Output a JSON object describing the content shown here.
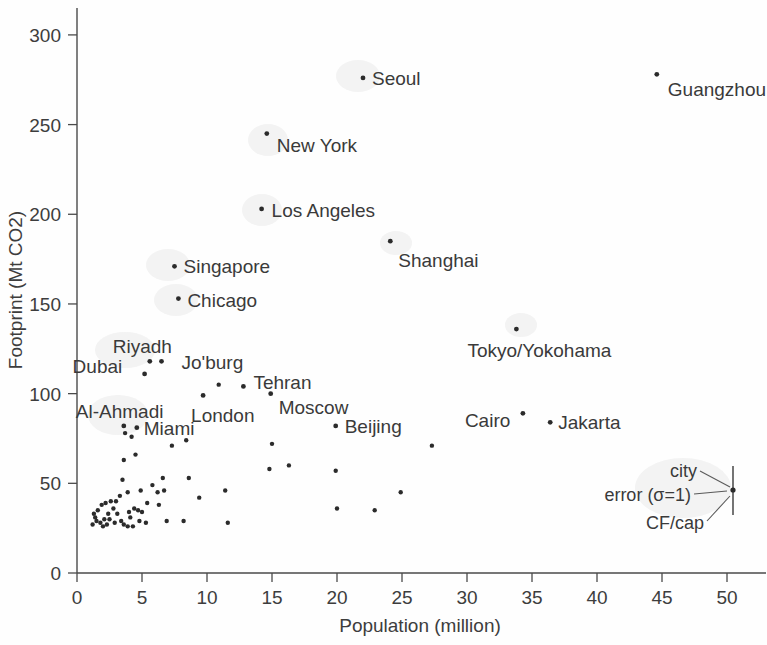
{
  "figure": {
    "background_color": "#fefefe",
    "ink_color": "#2b2b2b"
  },
  "chart_data": {
    "type": "scatter",
    "title": "",
    "xlabel": "Population (million)",
    "ylabel": "Footprint (Mt CO2)",
    "xlim": [
      0,
      53
    ],
    "ylim": [
      0,
      315
    ],
    "xticks": [
      0,
      5,
      10,
      15,
      20,
      25,
      30,
      35,
      40,
      45,
      50
    ],
    "xtick_labels": [
      "0",
      "5",
      "10",
      "15",
      "20",
      "25",
      "30",
      "35",
      "40",
      "45",
      "50"
    ],
    "yticks": [
      0,
      50,
      100,
      150,
      200,
      250,
      300
    ],
    "ytick_labels": [
      "0",
      "50",
      "100",
      "150",
      "200",
      "250",
      "300"
    ],
    "grid": false,
    "legend_position": "bottom-right",
    "labeled_points": [
      {
        "name": "Seoul",
        "x": 22.0,
        "y": 276,
        "label_dx": 9,
        "label_dy": 7
      },
      {
        "name": "Guangzhou",
        "x": 44.6,
        "y": 278,
        "label_dx": 11,
        "label_dy": 22
      },
      {
        "name": "New York",
        "x": 14.6,
        "y": 245,
        "label_dx": 10,
        "label_dy": 18
      },
      {
        "name": "Los Angeles",
        "x": 14.2,
        "y": 203,
        "label_dx": 10,
        "label_dy": 8
      },
      {
        "name": "Shanghai",
        "x": 24.1,
        "y": 185,
        "label_dx": 8,
        "label_dy": 26
      },
      {
        "name": "Singapore",
        "x": 7.5,
        "y": 171,
        "label_dx": 9,
        "label_dy": 7
      },
      {
        "name": "Chicago",
        "x": 7.8,
        "y": 153,
        "label_dx": 9,
        "label_dy": 8
      },
      {
        "name": "Tokyo/Yokohama",
        "x": 33.8,
        "y": 136,
        "label_dx": -49,
        "label_dy": 28
      },
      {
        "name": "Riyadh",
        "x": 5.6,
        "y": 118,
        "label_dx": -37,
        "label_dy": -8
      },
      {
        "name": "Dubai",
        "x": 5.2,
        "y": 111,
        "label_dx": -72,
        "label_dy": -1
      },
      {
        "name": "Jo'burg",
        "x": 6.5,
        "y": 118,
        "label_dx": 20,
        "label_dy": 8
      },
      {
        "name": "Tehran",
        "x": 12.8,
        "y": 104,
        "label_dx": 10,
        "label_dy": 3
      },
      {
        "name": "Moscow",
        "x": 14.9,
        "y": 100,
        "label_dx": 8,
        "label_dy": 20
      },
      {
        "name": "London",
        "x": 9.7,
        "y": 99,
        "label_dx": -12,
        "label_dy": 27
      },
      {
        "name": "Al-Ahmadi",
        "x": 3.6,
        "y": 82,
        "label_dx": -48,
        "label_dy": -8
      },
      {
        "name": "Miami",
        "x": 4.6,
        "y": 81,
        "label_dx": 7,
        "label_dy": 7
      },
      {
        "name": "Beijing",
        "x": 19.9,
        "y": 82,
        "label_dx": 9,
        "label_dy": 7
      },
      {
        "name": "Cairo",
        "x": 34.3,
        "y": 89,
        "label_dx": -58,
        "label_dy": 14
      },
      {
        "name": "Jakarta",
        "x": 36.4,
        "y": 84,
        "label_dx": 8,
        "label_dy": 7
      }
    ],
    "unlabeled_points": [
      {
        "x": 10.9,
        "y": 105
      },
      {
        "x": 16.3,
        "y": 60
      },
      {
        "x": 15.0,
        "y": 72
      },
      {
        "x": 14.8,
        "y": 58
      },
      {
        "x": 11.4,
        "y": 46
      },
      {
        "x": 9.4,
        "y": 42
      },
      {
        "x": 8.4,
        "y": 74
      },
      {
        "x": 8.6,
        "y": 53
      },
      {
        "x": 7.3,
        "y": 71
      },
      {
        "x": 6.6,
        "y": 53
      },
      {
        "x": 6.7,
        "y": 46
      },
      {
        "x": 6.2,
        "y": 45
      },
      {
        "x": 5.8,
        "y": 49
      },
      {
        "x": 5.4,
        "y": 39
      },
      {
        "x": 4.9,
        "y": 46
      },
      {
        "x": 4.5,
        "y": 66
      },
      {
        "x": 4.2,
        "y": 76
      },
      {
        "x": 3.7,
        "y": 78
      },
      {
        "x": 3.6,
        "y": 63
      },
      {
        "x": 3.5,
        "y": 52
      },
      {
        "x": 3.9,
        "y": 45
      },
      {
        "x": 3.3,
        "y": 43
      },
      {
        "x": 2.6,
        "y": 40
      },
      {
        "x": 2.2,
        "y": 39
      },
      {
        "x": 1.9,
        "y": 38
      },
      {
        "x": 1.6,
        "y": 35
      },
      {
        "x": 1.4,
        "y": 31
      },
      {
        "x": 1.2,
        "y": 27
      },
      {
        "x": 1.8,
        "y": 28
      },
      {
        "x": 2.1,
        "y": 30
      },
      {
        "x": 2.4,
        "y": 33
      },
      {
        "x": 2.8,
        "y": 36
      },
      {
        "x": 3.1,
        "y": 33
      },
      {
        "x": 3.4,
        "y": 29
      },
      {
        "x": 3.6,
        "y": 27
      },
      {
        "x": 3.9,
        "y": 26
      },
      {
        "x": 4.1,
        "y": 31
      },
      {
        "x": 4.4,
        "y": 36
      },
      {
        "x": 4.7,
        "y": 35
      },
      {
        "x": 4.3,
        "y": 26
      },
      {
        "x": 4.0,
        "y": 34
      },
      {
        "x": 5.0,
        "y": 34
      },
      {
        "x": 5.3,
        "y": 28
      },
      {
        "x": 6.3,
        "y": 38
      },
      {
        "x": 6.9,
        "y": 29
      },
      {
        "x": 8.2,
        "y": 29
      },
      {
        "x": 11.6,
        "y": 28
      },
      {
        "x": 19.9,
        "y": 57
      },
      {
        "x": 20.0,
        "y": 36
      },
      {
        "x": 22.9,
        "y": 35
      },
      {
        "x": 24.9,
        "y": 45
      },
      {
        "x": 27.3,
        "y": 71
      },
      {
        "x": 2.9,
        "y": 28
      },
      {
        "x": 2.0,
        "y": 26
      },
      {
        "x": 1.5,
        "y": 29
      },
      {
        "x": 2.3,
        "y": 27
      },
      {
        "x": 3.0,
        "y": 40
      },
      {
        "x": 2.5,
        "y": 30
      },
      {
        "x": 4.8,
        "y": 29
      },
      {
        "x": 1.3,
        "y": 33
      }
    ],
    "annotations": [
      {
        "name": "city",
        "text": "city"
      },
      {
        "name": "error-sigma",
        "text": "error (σ=1)"
      },
      {
        "name": "cf-per-cap",
        "text": "CF/cap"
      }
    ]
  },
  "axes": {
    "x_title": "Population (million)",
    "y_title": "Footprint (Mt CO2)"
  },
  "legend": {
    "city_label": "city",
    "error_label": "error (σ=1)",
    "cfcap_label": "CF/cap"
  }
}
